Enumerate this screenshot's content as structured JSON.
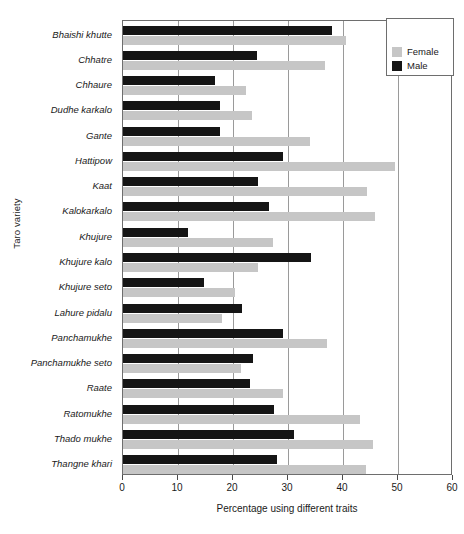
{
  "chart_data": {
    "type": "bar",
    "orientation": "horizontal",
    "title": "",
    "xlabel": "Percentage using different traits",
    "ylabel": "Taro variety",
    "xlim": [
      0,
      60
    ],
    "xticks": [
      0,
      10,
      20,
      30,
      40,
      50,
      60
    ],
    "grid": true,
    "grid_axis": "x",
    "legend_position": "top-right",
    "categories": [
      "Bhaishi khutte",
      "Chhatre",
      "Chhaure",
      "Dudhe karkalo",
      "Gante",
      "Hattipow",
      "Kaat",
      "Kalokarkalo",
      "Khujure",
      "Khujure kalo",
      "Khujure seto",
      "Lahure pidalu",
      "Panchamukhe",
      "Panchamukhe seto",
      "Raate",
      "Ratomukhe",
      "Thado mukhe",
      "Thangne khari"
    ],
    "series": [
      {
        "name": "Female",
        "color": "#c6c6c6",
        "values": [
          40.5,
          36.7,
          22.4,
          23.5,
          34.0,
          49.5,
          44.4,
          45.8,
          27.3,
          24.5,
          20.4,
          18.0,
          37.0,
          21.5,
          29.0,
          43.0,
          45.5,
          44.2
        ]
      },
      {
        "name": "Male",
        "color": "#151515",
        "values": [
          38.0,
          24.4,
          16.7,
          17.6,
          17.6,
          29.0,
          24.5,
          26.5,
          11.8,
          34.2,
          14.7,
          21.6,
          29.0,
          23.6,
          23.0,
          27.5,
          31.0,
          28.0
        ]
      }
    ]
  },
  "legend": {
    "entries": [
      {
        "label": "Female",
        "color": "#c6c6c6"
      },
      {
        "label": "Male",
        "color": "#151515"
      }
    ]
  }
}
